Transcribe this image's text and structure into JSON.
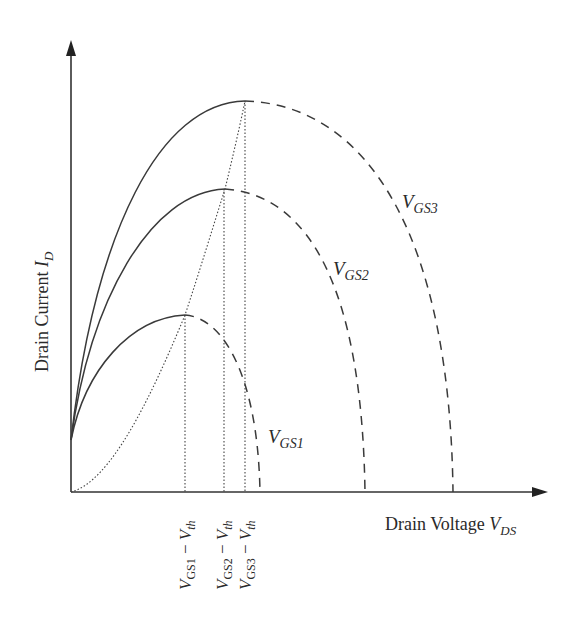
{
  "axes": {
    "y_label": {
      "text": "Drain Current ",
      "var": "I",
      "sub": "D"
    },
    "x_label": {
      "text": "Drain Voltage ",
      "var": "V",
      "sub": "DS"
    }
  },
  "curves": [
    {
      "name": "VGS1",
      "label_var": "V",
      "label_sub": "GS1",
      "peak": [
        185,
        315
      ],
      "end_x": 260
    },
    {
      "name": "VGS2",
      "label_var": "V",
      "label_sub": "GS2",
      "peak": [
        225,
        189
      ],
      "end_x": 365
    },
    {
      "name": "VGS3",
      "label_var": "V",
      "label_sub": "GS3",
      "peak": [
        245,
        101
      ],
      "end_x": 453
    }
  ],
  "x_ticks": [
    {
      "var": "V",
      "sub": "GS1",
      "minus": " − ",
      "var2": "V",
      "sub2": "th"
    },
    {
      "var": "V",
      "sub": "GS2",
      "minus": " − ",
      "var2": "V",
      "sub2": "th"
    },
    {
      "var": "V",
      "sub": "GS3",
      "minus": " − ",
      "var2": "V",
      "sub2": "th"
    }
  ],
  "legend_styles": {
    "solid": "linear/triode region",
    "dashed": "continuation beyond saturation point",
    "dotted": "V_DS = V_GS − V_th boundary"
  },
  "colors": {
    "line": "#3a3a3a",
    "axis": "#333333",
    "background": "#ffffff"
  }
}
